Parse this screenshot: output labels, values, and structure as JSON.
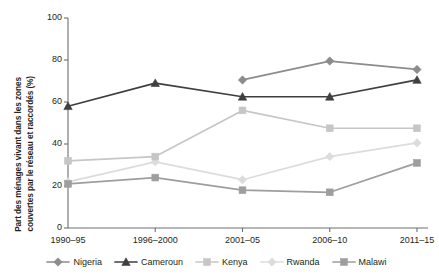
{
  "chart_data": {
    "type": "line",
    "title": "",
    "subtitle": "",
    "xlabel": "",
    "ylabel": "Part des ménages vivant dans les zones couvertes par le réseau et raccordés (%)",
    "ylabel_lines": [
      "Part des ménages vivant dans les zones",
      "couvertes par le réseau et raccordés (%)"
    ],
    "categories": [
      "1990–95",
      "1996–2000",
      "2001–05",
      "2006–10",
      "2011–15"
    ],
    "ylim": [
      0,
      100
    ],
    "yticks": [
      0,
      20,
      40,
      60,
      80,
      100
    ],
    "ytick_labels": [
      "0",
      "20",
      "40",
      "60",
      "80",
      "100"
    ],
    "grid": false,
    "legend_position": "bottom",
    "series": [
      {
        "name": "Nigeria",
        "marker": "diamond",
        "color": "#8c8c8c",
        "values": [
          null,
          null,
          70.5,
          79.5,
          75.5
        ]
      },
      {
        "name": "Cameroun",
        "marker": "triangle",
        "color": "#3f3f3f",
        "values": [
          58,
          69,
          62.5,
          62.5,
          70.5
        ]
      },
      {
        "name": "Kenya",
        "marker": "square",
        "color": "#c6c6c6",
        "values": [
          32,
          34,
          56,
          47.5,
          47.5
        ]
      },
      {
        "name": "Rwanda",
        "marker": "diamond",
        "color": "#dcdcdc",
        "values": [
          22,
          31.5,
          23,
          34,
          40.5
        ]
      },
      {
        "name": "Malawi",
        "marker": "square",
        "color": "#9e9e9e",
        "values": [
          21,
          24,
          18,
          17,
          31
        ]
      }
    ]
  },
  "legend": {
    "items": [
      {
        "label": "Nigeria"
      },
      {
        "label": "Cameroun"
      },
      {
        "label": "Kenya"
      },
      {
        "label": "Rwanda"
      },
      {
        "label": "Malawi"
      }
    ]
  },
  "axis": {
    "y_ticks": [
      "0",
      "20",
      "40",
      "60",
      "80",
      "100"
    ],
    "x_ticks": [
      "1990–95",
      "1996–2000",
      "2001–05",
      "2006–10",
      "2011–15"
    ]
  },
  "colors": {
    "axis": "#6d6e71",
    "text": "#231f20",
    "background": "#ffffff"
  }
}
